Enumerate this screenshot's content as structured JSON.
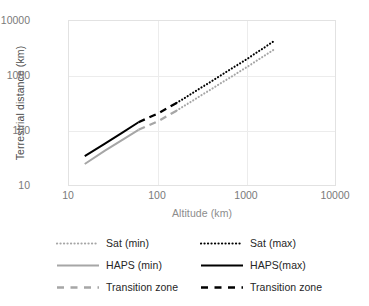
{
  "chart_data": {
    "type": "line",
    "title": "",
    "xlabel": "Altitude (km)",
    "ylabel": "Terrestrial distance (km)",
    "xscale": "log",
    "yscale": "log",
    "xlim": [
      10,
      10000
    ],
    "ylim": [
      10,
      10000
    ],
    "xticks": [
      "10",
      "100",
      "1000",
      "10000"
    ],
    "yticks": [
      "10",
      "100",
      "1000",
      "10000"
    ],
    "grid": true,
    "legend_position": "bottom",
    "series": [
      {
        "name": "Sat (min)",
        "style": "dotted",
        "color": "#a6a6a6",
        "x": [
          160,
          300,
          600,
          1000,
          2000
        ],
        "y": [
          240,
          450,
          900,
          1500,
          3100
        ]
      },
      {
        "name": "Sat (max)",
        "style": "dotted",
        "color": "#000000",
        "x": [
          160,
          300,
          600,
          1000,
          2000
        ],
        "y": [
          330,
          620,
          1250,
          2100,
          4400
        ]
      },
      {
        "name": "HAPS (min)",
        "style": "solid",
        "color": "#a6a6a6",
        "x": [
          15,
          25,
          40,
          60
        ],
        "y": [
          26,
          45,
          72,
          108
        ]
      },
      {
        "name": "HAPS(max)",
        "style": "solid",
        "color": "#000000",
        "x": [
          15,
          25,
          40,
          60
        ],
        "y": [
          36,
          60,
          97,
          148
        ]
      },
      {
        "name": "Transition zone",
        "style": "dashed",
        "color": "#a6a6a6",
        "x": [
          60,
          100,
          160
        ],
        "y": [
          108,
          155,
          240
        ]
      },
      {
        "name": "Transition zone",
        "style": "dashed",
        "color": "#000000",
        "x": [
          60,
          100,
          160
        ],
        "y": [
          148,
          215,
          330
        ]
      }
    ]
  },
  "axis": {
    "ylabel": "Terrestrial distance (km)",
    "xlabel": "Altitude (km)",
    "yticks": [
      {
        "label": "10000",
        "value": 10000
      },
      {
        "label": "1000",
        "value": 1000
      },
      {
        "label": "100",
        "value": 100
      },
      {
        "label": "10",
        "value": 10
      }
    ],
    "xticks": [
      {
        "label": "10",
        "value": 10
      },
      {
        "label": "100",
        "value": 100
      },
      {
        "label": "1000",
        "value": 1000
      },
      {
        "label": "10000",
        "value": 10000
      }
    ]
  },
  "legend": {
    "rows": [
      {
        "left_label": "Sat (min)",
        "left_style": "dotted",
        "left_color": "#a6a6a6",
        "right_label": "Sat (max)",
        "right_style": "dotted",
        "right_color": "#000000"
      },
      {
        "left_label": "HAPS (min)",
        "left_style": "solid",
        "left_color": "#a6a6a6",
        "right_label": "HAPS(max)",
        "right_style": "solid",
        "right_color": "#000000"
      },
      {
        "left_label": "Transition zone",
        "left_style": "dashed",
        "left_color": "#a6a6a6",
        "right_label": "Transition zone",
        "right_style": "dashed",
        "right_color": "#000000"
      }
    ]
  },
  "colors": {
    "gray_series": "#a6a6a6",
    "black_series": "#000000",
    "grid": "#ececec",
    "frame": "#e2e2e2",
    "tick_text": "#7a7a7a",
    "ylabel_text": "#4d4d4d",
    "xlabel_text": "#8c8c8c"
  }
}
